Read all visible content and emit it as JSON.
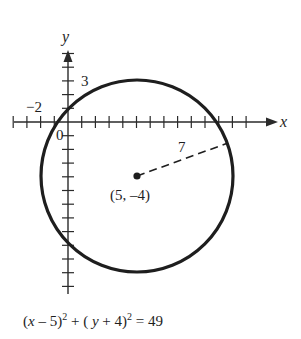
{
  "figure": {
    "type": "circle-on-coordinate-plane",
    "axes": {
      "x_label": "x",
      "y_label": "y",
      "origin_label": "0",
      "tick_label_y": "3",
      "tick_label_x": "−2",
      "x_ticks": [
        -4,
        -3,
        -2,
        -1,
        1,
        2,
        3,
        4,
        5,
        6,
        7,
        8,
        9,
        10,
        11,
        12,
        13
      ],
      "y_ticks": [
        5,
        4,
        3,
        2,
        1,
        -1,
        -2,
        -3,
        -4,
        -5,
        -6,
        -7,
        -8,
        -9,
        -10,
        -11,
        -12
      ]
    },
    "circle": {
      "center": [
        5,
        -4
      ],
      "radius": 7,
      "center_label": "(5, –4)",
      "radius_label": "7"
    },
    "equation": {
      "part1": "(",
      "var_x": "x",
      "part2": " – 5)",
      "exp1": "2",
      "part3": " + ( ",
      "var_y": "y",
      "part4": " + 4)",
      "exp2": "2",
      "part5": " = 49"
    },
    "colors": {
      "ink": "#1e1e1e",
      "background": "#ffffff"
    }
  }
}
